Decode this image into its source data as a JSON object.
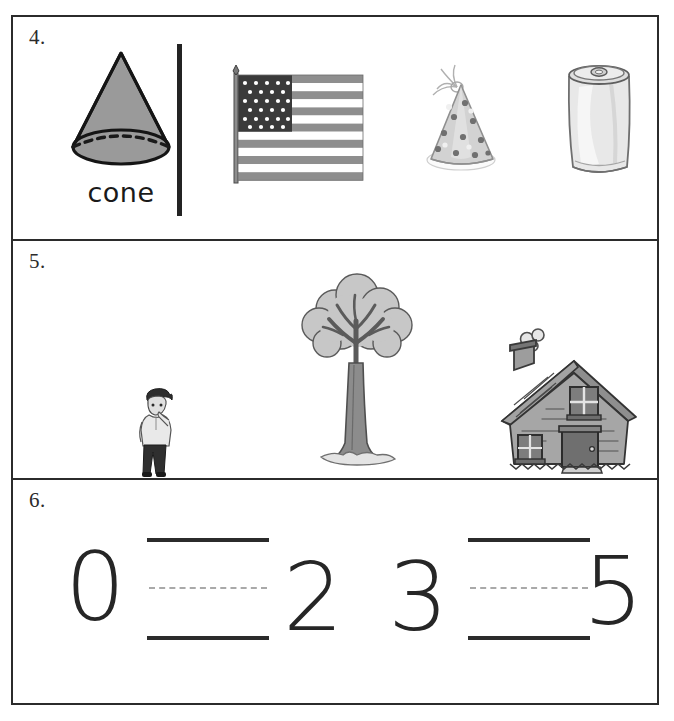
{
  "worksheet": {
    "rows": [
      {
        "number_label": "4.",
        "type": "shape-match",
        "prompt_shape": {
          "name": "cone",
          "label": "cone",
          "fill": "#9a9a9a",
          "stroke": "#1a1a1a"
        },
        "objects": [
          {
            "name": "american-flag",
            "alt": "American flag on pole"
          },
          {
            "name": "party-hat",
            "alt": "polka dot party hat"
          },
          {
            "name": "soda-can",
            "alt": "aluminum soda can"
          }
        ]
      },
      {
        "number_label": "5.",
        "type": "size-order",
        "objects": [
          {
            "name": "person",
            "alt": "boy standing"
          },
          {
            "name": "tree",
            "alt": "tall leafy tree"
          },
          {
            "name": "house",
            "alt": "house with chimney and smoke"
          }
        ]
      },
      {
        "number_label": "6.",
        "type": "number-sequence",
        "sequence": [
          {
            "kind": "number",
            "value": "0"
          },
          {
            "kind": "blank",
            "value": ""
          },
          {
            "kind": "number",
            "value": "2"
          },
          {
            "kind": "number",
            "value": "3"
          },
          {
            "kind": "blank",
            "value": ""
          },
          {
            "kind": "number",
            "value": "5"
          }
        ]
      }
    ]
  },
  "artifact": {
    "text": ""
  }
}
